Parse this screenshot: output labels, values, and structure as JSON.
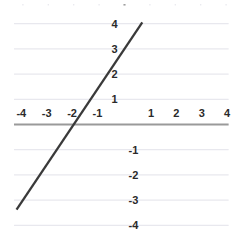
{
  "question_label": ")",
  "chart_data": {
    "type": "line",
    "title": "",
    "xlabel": "",
    "ylabel": "",
    "xlim": [
      -4.4,
      4.1
    ],
    "ylim": [
      -4.8,
      4.9
    ],
    "grid": true,
    "legend": null,
    "axis_color": "#9a9a9a",
    "grid_color": "#e8e8ee",
    "line_color": "#3a3a3a",
    "x_ticks": [
      -4,
      -3,
      -2,
      -1,
      1,
      2,
      3,
      4
    ],
    "y_ticks": [
      4,
      3,
      2,
      1,
      -1,
      -2,
      -3,
      -4
    ],
    "x_tick_labels": [
      "-4",
      "-3",
      "-2",
      "-1",
      "1",
      "2",
      "3",
      "4"
    ],
    "y_tick_labels": [
      "4",
      "3",
      "2",
      "1",
      "-1",
      "-2",
      "-3",
      "-4"
    ],
    "series": [
      {
        "name": "line",
        "equation": "y = 1.5x + 3",
        "slope": 1.5,
        "intercept": 3,
        "x_intercept": -2,
        "y_intercept": 3,
        "points": [
          [
            -4.25,
            -3.375
          ],
          [
            0.7,
            4.05
          ]
        ]
      }
    ]
  }
}
